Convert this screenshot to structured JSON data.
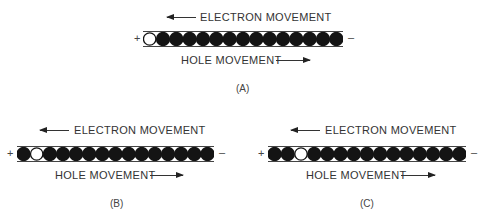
{
  "diagram": {
    "colors": {
      "electron": "#141414",
      "hole": "#ffffff",
      "line": "#333333"
    },
    "circles_per_bar": 15,
    "panels": [
      {
        "id": "A",
        "caption": "(A)",
        "electron_label": "ELECTRON MOVEMENT",
        "hole_label": "HOLE MOVEMENT",
        "positive": "+",
        "negative": "–",
        "hole_index": 0
      },
      {
        "id": "B",
        "caption": "(B)",
        "electron_label": "ELECTRON MOVEMENT",
        "hole_label": "HOLE MOVEMENT",
        "positive": "+",
        "negative": "–",
        "hole_index": 1
      },
      {
        "id": "C",
        "caption": "(C)",
        "electron_label": "ELECTRON MOVEMENT",
        "hole_label": "HOLE MOVEMENT",
        "positive": "+",
        "negative": "–",
        "hole_index": 2
      }
    ],
    "electron_direction": "left (toward +)",
    "hole_direction": "right (toward –)"
  }
}
